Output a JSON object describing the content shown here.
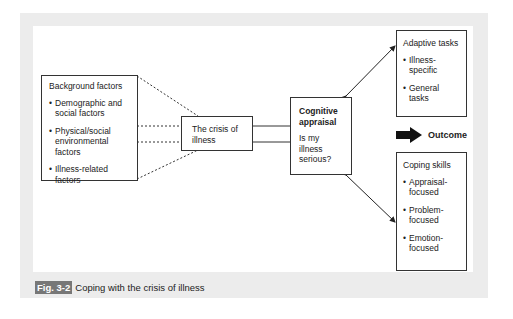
{
  "diagram": {
    "background_factors": {
      "title": "Background factors",
      "items": [
        "Demographic and social factors",
        "Physical/social environmental factors",
        "Illness-related factors"
      ]
    },
    "crisis": {
      "label": "The crisis of illness"
    },
    "cognitive_appraisal": {
      "title": "Cognitive appraisal",
      "question": "Is my illness serious?"
    },
    "adaptive_tasks": {
      "title": "Adaptive tasks",
      "items": [
        "Illness-specific",
        "General tasks"
      ]
    },
    "outcome": {
      "label": "Outcome"
    },
    "coping_skills": {
      "title": "Coping skills",
      "items": [
        "Appraisal-focused",
        "Problem-focused",
        "Emotion-focused"
      ]
    },
    "colors": {
      "frame": "#ececec",
      "line": "#333333",
      "caption_tag_bg": "#777777"
    }
  },
  "caption": {
    "tag": "Fig. 3-2",
    "text": "Coping with the crisis of illness"
  }
}
